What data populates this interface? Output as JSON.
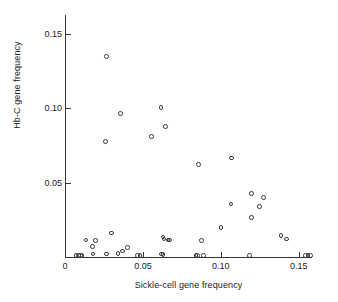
{
  "chart_data": {
    "type": "scatter",
    "title": "",
    "xlabel": "Sickle-cell gene frequency",
    "ylabel": "Hb-C gene frequency",
    "xlim": [
      0,
      0.1585
    ],
    "ylim": [
      0,
      0.1625
    ],
    "grid": false,
    "legend": null,
    "xticks": [
      {
        "value": 0,
        "label": "0"
      },
      {
        "value": 0.05,
        "label": "0.05"
      },
      {
        "value": 0.1,
        "label": "0.10"
      },
      {
        "value": 0.15,
        "label": "0.15"
      }
    ],
    "yticks": [
      {
        "value": 0.05,
        "label": "0.05"
      },
      {
        "value": 0.1,
        "label": "0.10"
      },
      {
        "value": 0.15,
        "label": "0.15"
      }
    ],
    "marker": "open-circle",
    "marker_color": "#3a3a3a",
    "n_points": 45,
    "points": [
      {
        "x": 0.0265,
        "y": 0.1345
      },
      {
        "x": 0.0615,
        "y": 0.1005
      },
      {
        "x": 0.0355,
        "y": 0.0965
      },
      {
        "x": 0.0645,
        "y": 0.0875
      },
      {
        "x": 0.0555,
        "y": 0.081
      },
      {
        "x": 0.026,
        "y": 0.0775
      },
      {
        "x": 0.107,
        "y": 0.0665
      },
      {
        "x": 0.0855,
        "y": 0.062
      },
      {
        "x": 0.1195,
        "y": 0.0425
      },
      {
        "x": 0.1275,
        "y": 0.04
      },
      {
        "x": 0.1065,
        "y": 0.0355
      },
      {
        "x": 0.125,
        "y": 0.034
      },
      {
        "x": 0.1195,
        "y": 0.0265
      },
      {
        "x": 0.1,
        "y": 0.02
      },
      {
        "x": 0.1385,
        "y": 0.0145
      },
      {
        "x": 0.03,
        "y": 0.016
      },
      {
        "x": 0.142,
        "y": 0.012
      },
      {
        "x": 0.0135,
        "y": 0.0115
      },
      {
        "x": 0.0195,
        "y": 0.011
      },
      {
        "x": 0.0875,
        "y": 0.011
      },
      {
        "x": 0.063,
        "y": 0.0135
      },
      {
        "x": 0.0635,
        "y": 0.012
      },
      {
        "x": 0.066,
        "y": 0.0115
      },
      {
        "x": 0.067,
        "y": 0.0115
      },
      {
        "x": 0.0175,
        "y": 0.007
      },
      {
        "x": 0.04,
        "y": 0.0065
      },
      {
        "x": 0.037,
        "y": 0.004
      },
      {
        "x": 0.018,
        "y": 0.002
      },
      {
        "x": 0.0265,
        "y": 0.002
      },
      {
        "x": 0.034,
        "y": 0.0025
      },
      {
        "x": 0.062,
        "y": 0.002
      },
      {
        "x": 0.063,
        "y": 0.0015
      },
      {
        "x": 0.007,
        "y": 0.001
      },
      {
        "x": 0.0085,
        "y": 0.001
      },
      {
        "x": 0.01,
        "y": 0.001
      },
      {
        "x": 0.011,
        "y": 0.001
      },
      {
        "x": 0.0465,
        "y": 0.001
      },
      {
        "x": 0.048,
        "y": 0.001
      },
      {
        "x": 0.084,
        "y": 0.001
      },
      {
        "x": 0.085,
        "y": 0.001
      },
      {
        "x": 0.089,
        "y": 0.001
      },
      {
        "x": 0.1185,
        "y": 0.001
      },
      {
        "x": 0.1545,
        "y": 0.001
      },
      {
        "x": 0.156,
        "y": 0.001
      },
      {
        "x": 0.1575,
        "y": 0.001
      }
    ]
  }
}
